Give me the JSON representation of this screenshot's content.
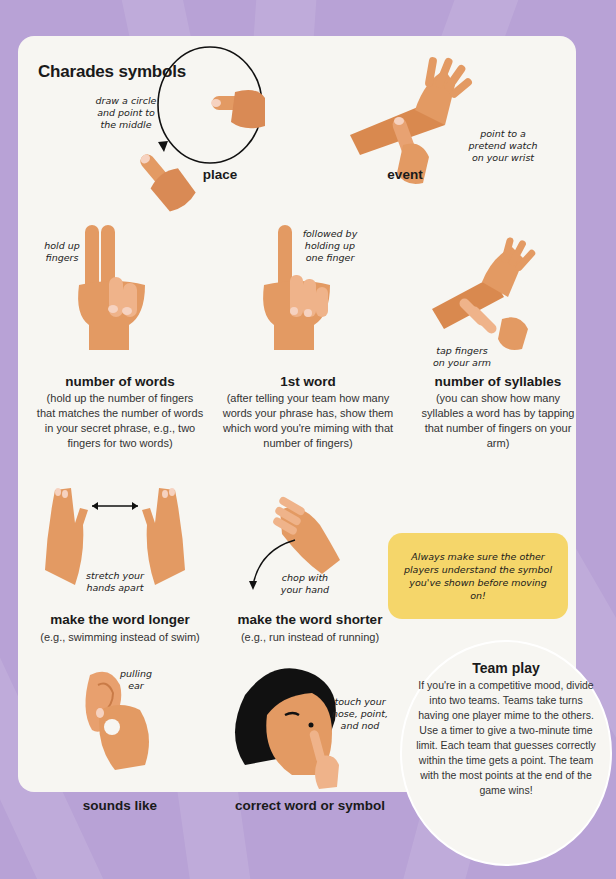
{
  "colors": {
    "background": "#b8a2d6",
    "card": "#f7f6f2",
    "skin": "#e39a63",
    "skin_dark": "#c97b47",
    "nail": "#f6d2c0",
    "callout": "#f5d66a",
    "hair": "#111111"
  },
  "title": "Charades symbols",
  "symbols": [
    {
      "id": "place",
      "label": "place",
      "note": "draw a circle and point to the middle",
      "icon": "circle-pointing-hand"
    },
    {
      "id": "event",
      "label": "event",
      "note": "point to a pretend watch on your wrist",
      "icon": "wrist-pointing-hand"
    },
    {
      "id": "number-of-words",
      "label": "number of words",
      "note": "hold up fingers",
      "description": "(hold up the number of fingers that matches the number of words in your secret phrase, e.g., two fingers for two words)",
      "icon": "two-fingers-hand"
    },
    {
      "id": "first-word",
      "label": "1st word",
      "note": "followed by holding up one finger",
      "description": "(after telling your team how many words your phrase has, show them which word you're miming with that number of fingers)",
      "icon": "one-finger-hand"
    },
    {
      "id": "number-of-syllables",
      "label": "number of syllables",
      "note": "tap fingers on your arm",
      "description": "(you can show how many syllables a word has by tapping that number of fingers on your arm)",
      "icon": "tapping-arm-hand"
    },
    {
      "id": "longer",
      "label": "make the word longer",
      "note": "stretch your hands apart",
      "description": "(e.g., swimming instead of swim)",
      "icon": "stretching-hands"
    },
    {
      "id": "shorter",
      "label": "make the word shorter",
      "note": "chop with your hand",
      "description": "(e.g., run instead of running)",
      "icon": "chopping-hand"
    },
    {
      "id": "sounds-like",
      "label": "sounds like",
      "note": "pulling ear",
      "icon": "ear-pull-hand"
    },
    {
      "id": "correct",
      "label": "correct word or symbol",
      "note": "touch your nose, point, and nod",
      "icon": "nose-touch-face"
    }
  ],
  "callout": "Always make sure the other players understand the symbol you've shown before moving on!",
  "team_play": {
    "title": "Team play",
    "body": "If you're in a competitive mood, divide into two teams. Teams take turns having one player mime to the others. Use a timer to give a two-minute time limit. Each team that guesses correctly within the time gets a point. The team with the most points at the end of the game wins!"
  }
}
